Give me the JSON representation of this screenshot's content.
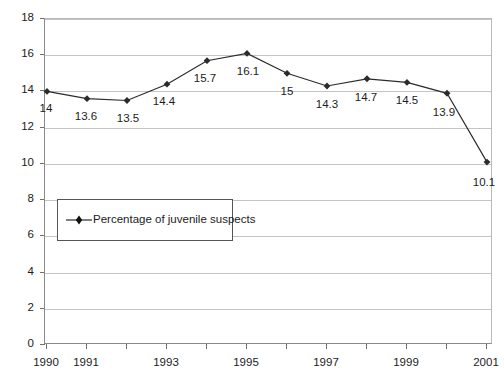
{
  "chart_data": {
    "type": "line",
    "title": "",
    "subtitle": "",
    "xlabel": "",
    "ylabel": "",
    "grid": true,
    "legend_position": "inside-left",
    "ylim": [
      0,
      18
    ],
    "ytick_step": 2,
    "yticks": [
      "0",
      "2",
      "4",
      "6",
      "8",
      "10",
      "12",
      "14",
      "16",
      "18"
    ],
    "x": [
      1990,
      1991,
      1992,
      1993,
      1994,
      1995,
      1996,
      1997,
      1998,
      1999,
      2000,
      2001
    ],
    "xtick_labels": [
      "1990",
      "1991",
      "",
      "1993",
      "",
      "1995",
      "",
      "1997",
      "",
      "1999",
      "",
      "2001"
    ],
    "categories": [
      "1990",
      "1991",
      "1992",
      "1993",
      "1994",
      "1995",
      "1996",
      "1997",
      "1998",
      "1999",
      "2000",
      "2001"
    ],
    "series": [
      {
        "name": "Percentage of juvenile suspects",
        "values": [
          14,
          13.6,
          13.5,
          14.4,
          15.7,
          16.1,
          15,
          14.3,
          14.7,
          14.5,
          13.9,
          10.1
        ],
        "point_labels": [
          "14",
          "13.6",
          "13.5",
          "14.4",
          "15.7",
          "16.1",
          "15",
          "14.3",
          "14.7",
          "14.5",
          "13.9",
          "10.1"
        ],
        "color": "#2b2b2b",
        "marker": "diamond"
      }
    ],
    "colors": {
      "series_line": "#2b2b2b",
      "marker": "#111111",
      "gridline": "#c4c4c4",
      "axis": "#8a8a8a",
      "text": "#1c1c1c",
      "legend_border": "#555555",
      "background": "#ffffff"
    }
  },
  "legend": {
    "label": "Percentage of juvenile suspects"
  }
}
